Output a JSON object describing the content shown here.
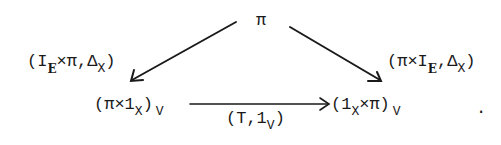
{
  "diagram": {
    "type": "commutative-triangle",
    "nodes": {
      "top": {
        "label": "π"
      },
      "bottom_left": {
        "open": "(π×1",
        "sub": "X",
        "close": ")",
        "outer_sub": "V"
      },
      "bottom_right": {
        "open": "(1",
        "sub": "X",
        "mid": "×π)",
        "outer_sub": "V"
      }
    },
    "arrows": {
      "left": {
        "from": "top",
        "to": "bottom_left",
        "label": {
          "p1": "(I",
          "sub1": "E",
          "p2": "×π,Δ",
          "sub2": "X",
          "p3": ")"
        }
      },
      "right": {
        "from": "top",
        "to": "bottom_right",
        "label": {
          "p1": "(π×I",
          "sub1": "E",
          "p2": ",Δ",
          "sub2": "X",
          "p3": ")"
        }
      },
      "bottom": {
        "from": "bottom_left",
        "to": "bottom_right",
        "label": {
          "p1": "(T,1",
          "sub1": "V",
          "p2": ")"
        }
      }
    },
    "trailing_punctuation": ".",
    "ink_color": "#1a1a1a"
  }
}
